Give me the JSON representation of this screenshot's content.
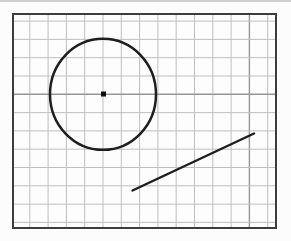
{
  "figure": {
    "canvas": {
      "width": 291,
      "height": 241,
      "background": "#fcfcfc"
    },
    "top_rule": {
      "x": 0,
      "y": 0,
      "width": 291,
      "height": 2,
      "color": "#cfcfcf"
    },
    "grid_box": {
      "x": 13,
      "y": 14,
      "width": 263,
      "height": 214,
      "fill": "#fdfdfd",
      "border_color": "#3d3d3d",
      "border_width": 2
    },
    "grid": {
      "spacing": 18.3,
      "offset_x": 16.8,
      "offset_y": 7.1,
      "line_color": "#bfbfbf",
      "line_width": 1,
      "emphasized_h_index": 4,
      "emphasized_v_index": 12,
      "emphasized_color": "#979797",
      "emphasized_width": 1.4
    },
    "circle": {
      "cx": 103,
      "cy": 94.3,
      "rx": 53,
      "ry": 55.5,
      "stroke": "#1e1e1e",
      "stroke_width": 2.5,
      "fill": "none"
    },
    "center_dot": {
      "cx": 103.5,
      "cy": 94,
      "size": 5,
      "color": "#0e0e0e"
    },
    "segment": {
      "x1": 132.5,
      "y1": 190.5,
      "x2": 254,
      "y2": 133.5,
      "stroke": "#1e1e1e",
      "stroke_width": 2.4,
      "linecap": "round"
    }
  }
}
